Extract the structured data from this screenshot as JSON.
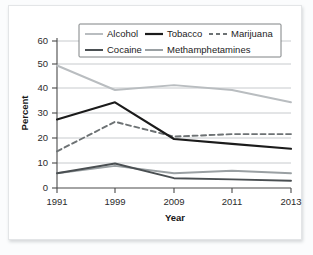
{
  "chart_data": {
    "type": "line",
    "title": "",
    "xlabel": "Year",
    "ylabel": "Percent",
    "x": [
      1991,
      1999,
      2009,
      2011,
      2013
    ],
    "xtick_labels": [
      "1991",
      "1999",
      "2009",
      "2011",
      "2013"
    ],
    "ytick_labels": [
      "0",
      "10",
      "20",
      "30",
      "40",
      "50",
      "60"
    ],
    "yticks": [
      0,
      10,
      20,
      30,
      40,
      50,
      60
    ],
    "ylim": [
      0,
      60
    ],
    "grid": "horizontal",
    "legend_position": "top-center",
    "series": [
      {
        "name": "Alcohol",
        "color": "#b9bdc0",
        "style": "solid",
        "values": [
          50,
          40,
          42,
          40,
          35
        ]
      },
      {
        "name": "Tobacco",
        "color": "#1b1b1b",
        "style": "solid",
        "values": [
          28,
          35,
          20,
          18,
          16
        ]
      },
      {
        "name": "Marijuana",
        "color": "#6d7274",
        "style": "dashed",
        "values": [
          15,
          27,
          21,
          22,
          22
        ]
      },
      {
        "name": "Cocaine",
        "color": "#4a4f52",
        "style": "solid",
        "values": [
          6,
          10,
          4,
          3.5,
          3
        ]
      },
      {
        "name": "Methamphetamines",
        "color": "#9aa0a3",
        "style": "solid",
        "values": [
          6,
          9,
          6,
          7,
          6
        ]
      }
    ]
  },
  "legend": {
    "entries": [
      {
        "label": "Alcohol"
      },
      {
        "label": "Tobacco"
      },
      {
        "label": "Marijuana"
      },
      {
        "label": "Cocaine"
      },
      {
        "label": "Methamphetamines"
      }
    ]
  },
  "axes": {
    "y_title": "Percent",
    "x_title": "Year"
  }
}
